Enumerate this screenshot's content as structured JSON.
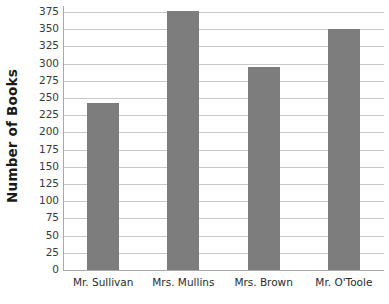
{
  "chart_data": {
    "type": "bar",
    "title": "",
    "subtitle": "",
    "xlabel": "",
    "ylabel": "Number of Books",
    "categories": [
      "Mr. Sullivan",
      "Mrs. Mullins",
      "Mrs. Brown",
      "Mr. O'Toole"
    ],
    "values": [
      243,
      377,
      295,
      350
    ],
    "series": [
      {
        "name": "Number of Books",
        "values": [
          243,
          377,
          295,
          350
        ]
      }
    ],
    "ylim": [
      0,
      375
    ],
    "ytick_step": 25,
    "ytick_labels": [
      "375",
      "350",
      "325",
      "300",
      "275",
      "250",
      "225",
      "200",
      "175",
      "150",
      "125",
      "100",
      "75",
      "50",
      "25",
      "0"
    ],
    "ytick_values": [
      375,
      350,
      325,
      300,
      275,
      250,
      225,
      200,
      175,
      150,
      125,
      100,
      75,
      50,
      25,
      0
    ],
    "grid": true,
    "grid_axis": "y",
    "legend": false,
    "legend_position": "none",
    "annotations": [],
    "colors": {
      "bar": "#7d7d7d",
      "gridline": "#c9c9c9",
      "axis": "#a9a9a9",
      "text": "#2b2b2b",
      "title_text": "#1a1a1a",
      "background": "#ffffff"
    }
  }
}
